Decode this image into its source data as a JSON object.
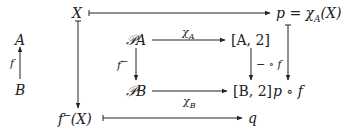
{
  "diagram": {
    "nodes": {
      "X": "X",
      "p_eq": "p = χ",
      "p_eq_sub": "A",
      "p_eq_tail": "(X)",
      "A": "A",
      "B": "B",
      "PA": "𝒫A",
      "A2": "[A, 2]",
      "PB": "𝒫B",
      "B2": "[B, 2]",
      "pof": "p ∘ f",
      "fX": "f",
      "fX_sup": "←",
      "fX_tail": "(X)",
      "q": "q"
    },
    "labels": {
      "f": "f",
      "f_inv": "f",
      "f_inv_sup": "←",
      "chiA": "χ",
      "chiA_sub": "A",
      "chiB": "χ",
      "chiB_sub": "B",
      "minus_o_f": "− ∘ f"
    },
    "colors": {
      "ink": "#222222",
      "background": "#ffffff"
    }
  }
}
